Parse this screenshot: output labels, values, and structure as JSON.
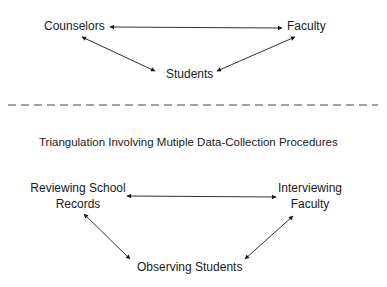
{
  "top_diagram": {
    "nodes": {
      "counselors": "Counselors",
      "faculty": "Faculty",
      "students": "Students"
    },
    "edges": [
      {
        "from": "Counselors",
        "to": "Faculty",
        "type": "bidirectional"
      },
      {
        "from": "Counselors",
        "to": "Students",
        "type": "bidirectional"
      },
      {
        "from": "Faculty",
        "to": "Students",
        "type": "bidirectional"
      }
    ]
  },
  "divider": {
    "style": "dashed"
  },
  "bottom_diagram": {
    "title": "Triangulation Involving Mutiple Data-Collection Procedures",
    "nodes": {
      "records_line1": "Reviewing School",
      "records_line2": "Records",
      "interview_line1": "Interviewing",
      "interview_line2": "Faculty",
      "observing": "Observing Students"
    },
    "edges": [
      {
        "from": "Reviewing School Records",
        "to": "Interviewing Faculty",
        "type": "bidirectional"
      },
      {
        "from": "Reviewing School Records",
        "to": "Observing Students",
        "type": "bidirectional"
      },
      {
        "from": "Interviewing Faculty",
        "to": "Observing Students",
        "type": "bidirectional"
      }
    ]
  },
  "colors": {
    "ink": "#1a1a1a",
    "background": "#ffffff"
  }
}
